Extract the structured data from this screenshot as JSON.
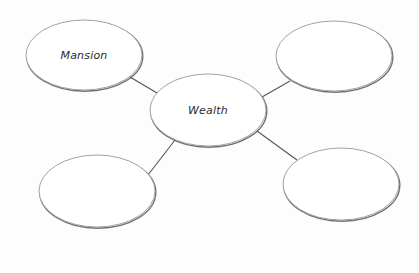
{
  "diagram": {
    "type": "bubble-map",
    "center": {
      "id": "center",
      "label": "Wealth",
      "cx": 208,
      "cy": 110,
      "rx": 58,
      "ry": 36
    },
    "nodes": [
      {
        "id": "top-left",
        "label": "Mansion",
        "cx": 84,
        "cy": 55,
        "rx": 58,
        "ry": 35
      },
      {
        "id": "top-right",
        "label": "",
        "cx": 334,
        "cy": 56,
        "rx": 58,
        "ry": 35
      },
      {
        "id": "bottom-left",
        "label": "",
        "cx": 97,
        "cy": 191,
        "rx": 58,
        "ry": 36
      },
      {
        "id": "bottom-right",
        "label": "",
        "cx": 341,
        "cy": 184,
        "rx": 58,
        "ry": 36
      }
    ],
    "connectors": [
      {
        "from": "top-left",
        "to": "center",
        "x1": 130,
        "y1": 77,
        "x2": 157,
        "y2": 93
      },
      {
        "from": "top-right",
        "to": "center",
        "x1": 290,
        "y1": 81,
        "x2": 262,
        "y2": 97
      },
      {
        "from": "bottom-left",
        "to": "center",
        "x1": 148,
        "y1": 175,
        "x2": 175,
        "y2": 140
      },
      {
        "from": "bottom-right",
        "to": "center",
        "x1": 297,
        "y1": 160,
        "x2": 257,
        "y2": 131
      }
    ],
    "colors": {
      "stroke": "#555555",
      "fill": "#ffffff",
      "shadow": "#444444",
      "background": "#fdfdfd"
    }
  }
}
